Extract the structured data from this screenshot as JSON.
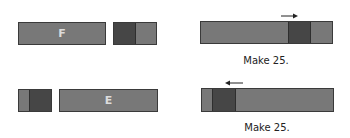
{
  "colors": {
    "bar_fill": "#787878",
    "dark_segment": "#464646",
    "border": "#3a3a3a",
    "letter": "#dcdcdc",
    "arrow": "#222222"
  },
  "row1": {
    "left_bar": {
      "label": "F"
    },
    "right_panel": {
      "caption": "Make 25.",
      "arrow_direction": "right"
    }
  },
  "row2": {
    "left_bar": {
      "label": "E"
    },
    "right_panel": {
      "caption": "Make 25.",
      "arrow_direction": "left"
    }
  }
}
